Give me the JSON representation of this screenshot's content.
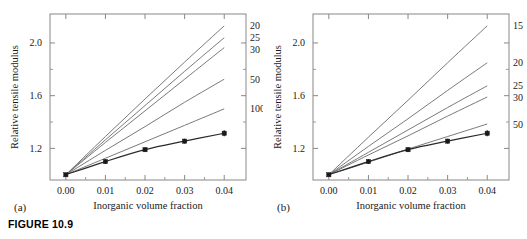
{
  "figure": {
    "caption": "FIGURE 10.9",
    "panel_a_tag": "(a)",
    "panel_b_tag": "(b)"
  },
  "chart_data": [
    {
      "type": "line",
      "panel": "(a)",
      "title": "",
      "xlabel": "Inorganic volume fraction",
      "ylabel": "Relative tensile modulus",
      "xlim": [
        -0.004,
        0.0455
      ],
      "ylim": [
        0.96,
        2.22
      ],
      "xticks": [
        0.0,
        0.01,
        0.02,
        0.03,
        0.04
      ],
      "xtick_labels": [
        "0.00",
        "0.01",
        "0.02",
        "0.03",
        "0.04"
      ],
      "yticks": [
        1.2,
        1.6,
        2.0
      ],
      "ytick_labels": [
        "1.2",
        "1.6",
        "2.0"
      ],
      "yminor_ticks": [
        1.4,
        1.8
      ],
      "grid": false,
      "legend": "inline-right-end-labels",
      "x": [
        0.0,
        0.01,
        0.02,
        0.03,
        0.04
      ],
      "series": [
        {
          "name": "20",
          "label": "20",
          "kind": "model-curve",
          "values": [
            1.0,
            1.29,
            1.575,
            1.855,
            2.13
          ]
        },
        {
          "name": "25",
          "label": "25",
          "kind": "model-curve",
          "values": [
            1.0,
            1.265,
            1.525,
            1.785,
            2.04
          ]
        },
        {
          "name": "30",
          "label": "30",
          "kind": "model-curve",
          "values": [
            1.0,
            1.245,
            1.485,
            1.725,
            1.965
          ]
        },
        {
          "name": "50",
          "label": "50",
          "kind": "model-curve",
          "values": [
            1.0,
            1.185,
            1.365,
            1.55,
            1.725
          ]
        },
        {
          "name": "100",
          "label": "100",
          "kind": "model-curve",
          "values": [
            1.0,
            1.125,
            1.25,
            1.375,
            1.5
          ]
        },
        {
          "name": "experimental",
          "label": "",
          "kind": "data-with-error-bars",
          "values": [
            1.0,
            1.1,
            1.19,
            1.255,
            1.315
          ],
          "errors": [
            0.012,
            0.018,
            0.018,
            0.018,
            0.022
          ]
        }
      ]
    },
    {
      "type": "line",
      "panel": "(b)",
      "title": "",
      "xlabel": "Inorganic volume fraction",
      "ylabel": "Relative tensile modulus",
      "xlim": [
        -0.004,
        0.0455
      ],
      "ylim": [
        0.96,
        2.22
      ],
      "xticks": [
        0.0,
        0.01,
        0.02,
        0.03,
        0.04
      ],
      "xtick_labels": [
        "0.00",
        "0.01",
        "0.02",
        "0.03",
        "0.04"
      ],
      "yticks": [
        1.2,
        1.6,
        2.0
      ],
      "ytick_labels": [
        "1.2",
        "1.6",
        "2.0"
      ],
      "yminor_ticks": [
        1.4,
        1.8
      ],
      "grid": false,
      "legend": "inline-right-end-labels",
      "x": [
        0.0,
        0.01,
        0.02,
        0.03,
        0.04
      ],
      "series": [
        {
          "name": "15",
          "label": "15",
          "kind": "model-curve",
          "values": [
            1.0,
            1.285,
            1.565,
            1.85,
            2.13
          ]
        },
        {
          "name": "20",
          "label": "20",
          "kind": "model-curve",
          "values": [
            1.0,
            1.215,
            1.425,
            1.64,
            1.85
          ]
        },
        {
          "name": "25",
          "label": "25",
          "kind": "model-curve",
          "values": [
            1.0,
            1.17,
            1.34,
            1.51,
            1.675
          ]
        },
        {
          "name": "30",
          "label": "30",
          "kind": "model-curve",
          "values": [
            1.0,
            1.15,
            1.295,
            1.445,
            1.59
          ]
        },
        {
          "name": "50",
          "label": "50",
          "kind": "model-curve",
          "values": [
            1.0,
            1.095,
            1.195,
            1.29,
            1.385
          ]
        },
        {
          "name": "experimental",
          "label": "",
          "kind": "data-with-error-bars",
          "values": [
            1.0,
            1.1,
            1.19,
            1.255,
            1.315
          ],
          "errors": [
            0.012,
            0.018,
            0.018,
            0.018,
            0.022
          ]
        }
      ]
    }
  ]
}
